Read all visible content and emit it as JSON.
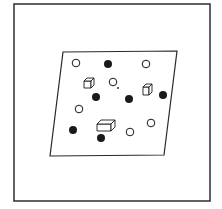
{
  "figure": {
    "frame": {
      "x": 14,
      "y": 4,
      "w": 196,
      "h": 197,
      "stroke": "#3a3a3a"
    },
    "plane": {
      "points": [
        [
          63,
          52
        ],
        [
          177,
          51
        ],
        [
          164,
          155
        ],
        [
          50,
          156
        ]
      ],
      "stroke": "#2a2a2a"
    },
    "open_circles": [
      {
        "cx": 76,
        "cy": 63
      },
      {
        "cx": 146,
        "cy": 64
      },
      {
        "cx": 113,
        "cy": 82
      },
      {
        "cx": 79,
        "cy": 109
      },
      {
        "cx": 151,
        "cy": 123
      },
      {
        "cx": 130,
        "cy": 132
      }
    ],
    "filled_circles": [
      {
        "cx": 108,
        "cy": 64
      },
      {
        "cx": 96,
        "cy": 97
      },
      {
        "cx": 129,
        "cy": 99
      },
      {
        "cx": 163,
        "cy": 95
      },
      {
        "cx": 73,
        "cy": 130
      },
      {
        "cx": 101,
        "cy": 138
      }
    ],
    "cubes": [
      {
        "x": 84,
        "y": 78,
        "w": 7,
        "h": 7,
        "d": 3
      },
      {
        "x": 143,
        "y": 84,
        "w": 6,
        "h": 8,
        "d": 3
      },
      {
        "x": 97,
        "y": 120,
        "w": 14,
        "h": 7,
        "d": 4
      }
    ],
    "dot": {
      "cx": 118,
      "cy": 88
    },
    "colors": {
      "ink": "#1a1a1a",
      "paper": "#ffffff"
    }
  }
}
